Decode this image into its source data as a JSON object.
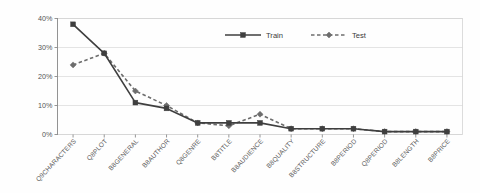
{
  "chart_data": {
    "type": "line",
    "title": "",
    "subtitle": "",
    "xlabel": "",
    "ylabel": "",
    "ylim": [
      0,
      40
    ],
    "ytick_labels": [
      "0%",
      "10%",
      "20%",
      "30%",
      "40%"
    ],
    "ytick_values": [
      0,
      10,
      20,
      30,
      40
    ],
    "grid": true,
    "legend_position": "top-center",
    "categories": [
      "Q9CHARACTERS",
      "Q8PLOT",
      "B8GENERAL",
      "B8AUTHOR",
      "Q8GENRE",
      "B8TITLE",
      "B8AUDIENCE",
      "B8QUALITY",
      "B8STRUCTURE",
      "B8PERIOD",
      "Q8PERIOD",
      "B8LENGTH",
      "B8PRICE"
    ],
    "series": [
      {
        "name": "Train",
        "color": "#3f3f3f",
        "line_style": "solid",
        "marker": "square",
        "values": [
          38,
          28,
          11,
          9,
          4,
          4,
          4,
          2,
          2,
          2,
          1,
          1,
          1
        ]
      },
      {
        "name": "Test",
        "color": "#6d6d6d",
        "line_style": "dashed",
        "marker": "diamond",
        "values": [
          24,
          28,
          15,
          10,
          4,
          3,
          7,
          2,
          2,
          2,
          1,
          1,
          1
        ]
      }
    ]
  },
  "legend": {
    "entries": [
      {
        "label": "Train"
      },
      {
        "label": "Test"
      }
    ]
  },
  "colors": {
    "train": "#3f3f3f",
    "test": "#6d6d6d",
    "grid": "#d9d9d9",
    "border": "#d4d4d4",
    "axis": "#8a8a8a",
    "label_text": "#5a5a5a"
  }
}
